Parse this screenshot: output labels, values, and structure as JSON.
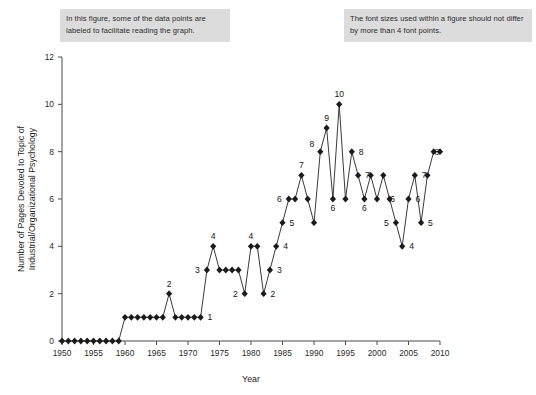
{
  "annotations": {
    "left_note": "In this figure, some of the data points are labeled to facilitate reading the graph.",
    "right_note": "The font sizes used within a figure should not differ by more than 4 font points."
  },
  "chart_data": {
    "type": "line",
    "title": "",
    "xlabel": "Year",
    "ylabel": "Number of Pages Devoted to Topic of Industrial/Organizational Psychology",
    "xlim": [
      1950,
      2010
    ],
    "ylim": [
      0,
      12
    ],
    "xticks": [
      1950,
      1955,
      1960,
      1965,
      1970,
      1975,
      1980,
      1985,
      1990,
      1995,
      2000,
      2005,
      2010
    ],
    "yticks": [
      0,
      2,
      4,
      6,
      8,
      10,
      12
    ],
    "grid": false,
    "legend": "none",
    "marker": "diamond",
    "x": [
      1950,
      1951,
      1952,
      1953,
      1954,
      1955,
      1956,
      1957,
      1958,
      1959,
      1960,
      1961,
      1962,
      1963,
      1964,
      1965,
      1966,
      1967,
      1968,
      1969,
      1970,
      1971,
      1972,
      1973,
      1974,
      1975,
      1976,
      1977,
      1978,
      1979,
      1980,
      1981,
      1982,
      1983,
      1984,
      1985,
      1986,
      1987,
      1988,
      1989,
      1990,
      1991,
      1992,
      1993,
      1994,
      1995,
      1996,
      1997,
      1998,
      1999,
      2000,
      2001,
      2002,
      2003,
      2004,
      2005,
      2006,
      2007,
      2008,
      2009,
      2010
    ],
    "values": [
      0,
      0,
      0,
      0,
      0,
      0,
      0,
      0,
      0,
      0,
      1,
      1,
      1,
      1,
      1,
      1,
      1,
      2,
      1,
      1,
      1,
      1,
      1,
      3,
      4,
      3,
      3,
      3,
      3,
      2,
      4,
      4,
      2,
      3,
      4,
      5,
      6,
      6,
      7,
      6,
      5,
      8,
      9,
      6,
      10,
      6,
      8,
      7,
      6,
      7,
      6,
      7,
      6,
      5,
      4,
      6,
      7,
      5,
      7,
      8,
      8
    ],
    "labeled_points": [
      {
        "x": 1967,
        "y": 2,
        "label": "2",
        "pos": "above"
      },
      {
        "x": 1973,
        "y": 3,
        "label": "3",
        "pos": "left"
      },
      {
        "x": 1974,
        "y": 4,
        "label": "4",
        "pos": "above"
      },
      {
        "x": 1972,
        "y": 1,
        "label": "1",
        "pos": "right"
      },
      {
        "x": 1979,
        "y": 2,
        "label": "2",
        "pos": "left"
      },
      {
        "x": 1980,
        "y": 4,
        "label": "4",
        "pos": "above"
      },
      {
        "x": 1982,
        "y": 2,
        "label": "2",
        "pos": "right"
      },
      {
        "x": 1983,
        "y": 3,
        "label": "3",
        "pos": "right"
      },
      {
        "x": 1984,
        "y": 4,
        "label": "4",
        "pos": "right"
      },
      {
        "x": 1985,
        "y": 5,
        "label": "5",
        "pos": "right"
      },
      {
        "x": 1986,
        "y": 6,
        "label": "6",
        "pos": "left"
      },
      {
        "x": 1988,
        "y": 7,
        "label": "7",
        "pos": "above"
      },
      {
        "x": 1991,
        "y": 8,
        "label": "8",
        "pos": "above-left"
      },
      {
        "x": 1992,
        "y": 9,
        "label": "9",
        "pos": "above"
      },
      {
        "x": 1994,
        "y": 10,
        "label": "10",
        "pos": "above"
      },
      {
        "x": 1993,
        "y": 6,
        "label": "6",
        "pos": "below"
      },
      {
        "x": 1996,
        "y": 8,
        "label": "8",
        "pos": "right"
      },
      {
        "x": 1997,
        "y": 7,
        "label": "7",
        "pos": "right"
      },
      {
        "x": 1998,
        "y": 6,
        "label": "6",
        "pos": "below"
      },
      {
        "x": 2001,
        "y": 6,
        "label": "6",
        "pos": "right"
      },
      {
        "x": 2003,
        "y": 5,
        "label": "5",
        "pos": "left"
      },
      {
        "x": 2004,
        "y": 4,
        "label": "4",
        "pos": "right"
      },
      {
        "x": 2005,
        "y": 6,
        "label": "6",
        "pos": "right"
      },
      {
        "x": 2006,
        "y": 7,
        "label": "7",
        "pos": "right"
      },
      {
        "x": 2007,
        "y": 5,
        "label": "5",
        "pos": "right"
      },
      {
        "x": 2008,
        "y": 8,
        "label": "8",
        "pos": "right"
      }
    ]
  }
}
